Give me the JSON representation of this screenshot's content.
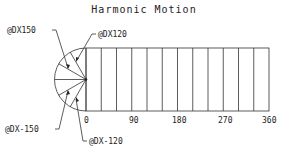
{
  "title": "Harmonic Motion",
  "colors": {
    "line": "#333333",
    "text": "#222222",
    "background": "#ffffff"
  },
  "axis": {
    "ticks": [
      {
        "label": "0",
        "value": 0
      },
      {
        "label": "90",
        "value": 90
      },
      {
        "label": "180",
        "value": 180
      },
      {
        "label": "270",
        "value": 270
      },
      {
        "label": "360",
        "value": 360
      }
    ],
    "divisions": 12
  },
  "callouts": [
    {
      "id": "d150",
      "text": "@DX150"
    },
    {
      "id": "d120",
      "text": "@DX120"
    },
    {
      "id": "dm150",
      "text": "@DX-150"
    },
    {
      "id": "dm120",
      "text": "@DX-120"
    }
  ],
  "semicircle": {
    "rays_deg": [
      90,
      120,
      150,
      180,
      210,
      240,
      270
    ]
  }
}
